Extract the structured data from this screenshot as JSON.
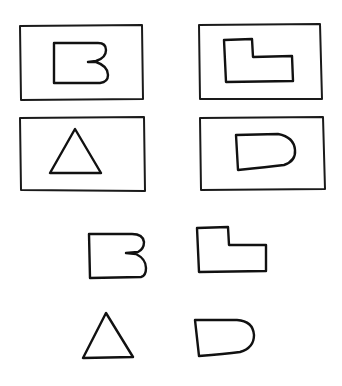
{
  "diagram": {
    "type": "hand-drawn shape matching puzzle",
    "background": "#ffffff",
    "ink_color": "#111111",
    "boxed_shapes": [
      {
        "id": "box-top-left",
        "shape": "b-shape",
        "position": "row 1, column 1"
      },
      {
        "id": "box-top-right",
        "shape": "l-shape",
        "position": "row 1, column 2"
      },
      {
        "id": "box-bottom-left",
        "shape": "triangle",
        "position": "row 2, column 1"
      },
      {
        "id": "box-bottom-right",
        "shape": "d-shape",
        "position": "row 2, column 2"
      }
    ],
    "loose_shapes": [
      {
        "id": "loose-b",
        "shape": "b-shape",
        "position": "row 1, column 1"
      },
      {
        "id": "loose-l",
        "shape": "l-shape",
        "position": "row 1, column 2"
      },
      {
        "id": "loose-triangle",
        "shape": "triangle",
        "position": "row 2, column 1"
      },
      {
        "id": "loose-d",
        "shape": "d-shape",
        "position": "row 2, column 2"
      }
    ]
  }
}
